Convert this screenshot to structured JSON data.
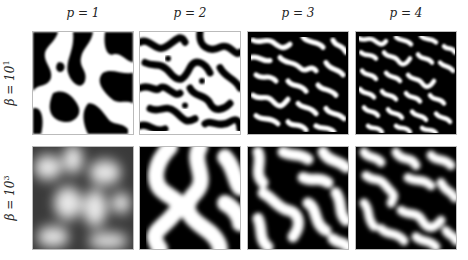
{
  "figure": {
    "columns": [
      {
        "label": "p = 1",
        "x": 32
      },
      {
        "label": "p = 2",
        "x": 139
      },
      {
        "label": "p = 3",
        "x": 247
      },
      {
        "label": "p = 4",
        "x": 355
      }
    ],
    "rows": [
      {
        "label_prefix": "β = 10",
        "exponent": "1",
        "y": 31,
        "style": "sharp"
      },
      {
        "label_prefix": "β = 10",
        "exponent": "3",
        "y": 146,
        "style": "smooth"
      }
    ],
    "panels": [
      {
        "row": 0,
        "col": 0,
        "description": "sharp black/white labyrinth, coarse features"
      },
      {
        "row": 0,
        "col": 1,
        "description": "sharp black/white labyrinth, medium features"
      },
      {
        "row": 0,
        "col": 2,
        "description": "sharp black/white labyrinth, fine features"
      },
      {
        "row": 0,
        "col": 3,
        "description": "sharp black/white labyrinth, finest features"
      },
      {
        "row": 1,
        "col": 0,
        "description": "blurry grayscale blobs"
      },
      {
        "row": 1,
        "col": 1,
        "description": "smooth black/white wide stripes"
      },
      {
        "row": 1,
        "col": 2,
        "description": "smooth black/white stripes, medium"
      },
      {
        "row": 1,
        "col": 3,
        "description": "smooth black/white stripes, finer"
      }
    ],
    "colors": {
      "foreground": "#000000",
      "background": "#ffffff",
      "border": "#bbbbbb"
    }
  }
}
